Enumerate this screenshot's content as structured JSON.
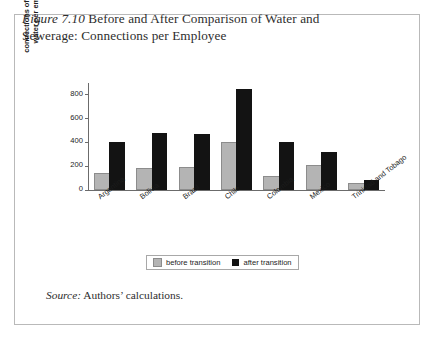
{
  "figure": {
    "number_label": "Figure 7.10",
    "caption_text": " Before and After Comparison of Water and Sewerage: Connections per Employee",
    "source_label": "Source:",
    "source_text": " Authors’ calculations."
  },
  "legend": {
    "before_label": "before transition",
    "after_label": "after transition"
  },
  "colors": {
    "before": "#b4b4b4",
    "after": "#131313",
    "axis": "#6b6b6b",
    "frame": "#b9b9b9",
    "text": "#1c1c1c"
  },
  "chart_data": {
    "type": "bar",
    "title": "Figure 7.10 Before and After Comparison of Water and Sewerage: Connections per Employee",
    "xlabel": "",
    "ylabel_line1": "connections of drinkable",
    "ylabel_line2": "water per employee",
    "ylabel": "connections of drinkable water per employee",
    "categories": [
      "Argentina",
      "Bolivia",
      "Brazil",
      "Chile",
      "Colombia",
      "Mexico",
      "Trinidad and Tobago"
    ],
    "series": [
      {
        "name": "before transition",
        "color": "#b4b4b4",
        "values": [
          130,
          170,
          175,
          390,
          100,
          190,
          45
        ]
      },
      {
        "name": "after transition",
        "color": "#131313",
        "values": [
          400,
          480,
          470,
          850,
          400,
          320,
          85
        ]
      }
    ],
    "ylim": [
      0,
      900
    ],
    "yticks": [
      0,
      200,
      400,
      600,
      800
    ],
    "ytick_labels": [
      "0",
      "200",
      "400",
      "600",
      "800"
    ],
    "grid": false,
    "legend_position": "bottom-center"
  }
}
